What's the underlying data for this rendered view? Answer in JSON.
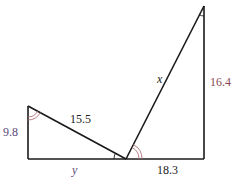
{
  "diagram": {
    "type": "geometry-two-triangles",
    "colors": {
      "line": "#1a1a1a",
      "arc": "#b0707a",
      "label_black": "#222222",
      "label_purple": "#5a4a7a",
      "label_red": "#8a4a55"
    },
    "points": {
      "A": [
        28,
        106
      ],
      "B": [
        28,
        159
      ],
      "C": [
        126,
        159
      ],
      "D": [
        204,
        159
      ],
      "E": [
        204,
        6
      ]
    },
    "labels": {
      "left_vertical": "9.8",
      "left_hypotenuse": "15.5",
      "left_base": "y",
      "right_base": "18.3",
      "right_hypotenuse": "x",
      "right_vertical": "16.4"
    }
  }
}
